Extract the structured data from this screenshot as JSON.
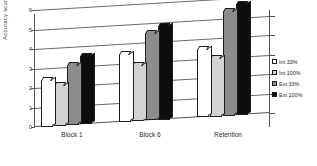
{
  "chart_data": {
    "type": "bar",
    "title": "",
    "xlabel": "",
    "ylabel": "Accuracy score",
    "categories": [
      "Block 1",
      "Block 6",
      "Retention"
    ],
    "ylim": [
      0,
      6
    ],
    "yticks": [
      0,
      1,
      2,
      3,
      4,
      5,
      6
    ],
    "ytick_labels": [
      "0",
      "1",
      "2",
      "3",
      "4",
      "5",
      "6"
    ],
    "grid": true,
    "legend_position": "right",
    "series": [
      {
        "name": "Int 33%",
        "color": "#ffffff",
        "values": [
          2.4,
          3.5,
          3.5
        ]
      },
      {
        "name": "Int 100%",
        "color": "#d2d2d2",
        "values": [
          2.1,
          2.9,
          3.0
        ]
      },
      {
        "name": "Ext 33%",
        "color": "#8c8c8c",
        "values": [
          3.1,
          4.5,
          5.4
        ]
      },
      {
        "name": "Ext 100%",
        "color": "#0d0d0d",
        "values": [
          3.5,
          4.8,
          5.7
        ]
      }
    ]
  },
  "axis": {
    "y_title": "Accuracy score"
  },
  "legend": {
    "items": [
      {
        "label": "Int 33%"
      },
      {
        "label": "Int 100%"
      },
      {
        "label": "Ext 33%"
      },
      {
        "label": "Ext 100%"
      }
    ]
  }
}
